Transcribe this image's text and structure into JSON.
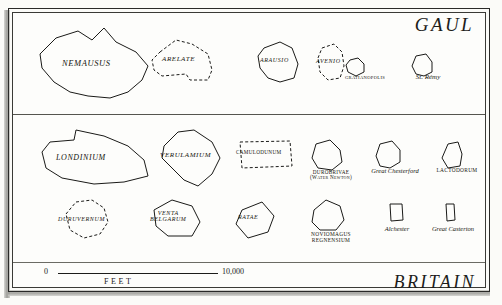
{
  "plate": {
    "background_color": "#fdfdfb",
    "ink_color": "#1a1a18"
  },
  "regions": [
    {
      "id": "gaul",
      "title": "GAUL"
    },
    {
      "id": "britain",
      "title": "BRITAIN"
    }
  ],
  "scale": {
    "zero_label": "0",
    "max_label": "10,000",
    "unit_label": "FEET"
  },
  "towns": [
    {
      "name": "NEMAUSUS",
      "region": "gaul",
      "label_position": "inside",
      "label_style": "small-caps-italic",
      "outline": "solid",
      "font_size": 8.5,
      "x": 32,
      "y": 26,
      "w": 120,
      "h": 74,
      "points": "24,12 46,5 60,14 72,2 84,16 104,26 116,40 110,54 96,66 78,72 56,70 38,66 22,56 10,42 8,28",
      "label_x": 30,
      "label_y": 33
    },
    {
      "name": "ARELATE",
      "region": "gaul",
      "label_position": "inside",
      "label_style": "small-caps-italic",
      "outline": "dashed",
      "font_size": 7,
      "x": 146,
      "y": 36,
      "w": 78,
      "h": 52,
      "points": "14,16 30,4 46,8 62,18 66,34 62,44 44,44 40,38 16,40 8,34 6,24",
      "label_x": 16,
      "label_y": 20
    },
    {
      "name": "ARAUSIO",
      "region": "gaul",
      "label_position": "inside",
      "label_style": "small-caps-italic",
      "outline": "solid",
      "font_size": 6,
      "x": 254,
      "y": 38,
      "w": 50,
      "h": 48,
      "points": "10,10 26,4 38,10 44,26 40,40 26,44 14,40 6,30 4,18",
      "label_x": 6,
      "label_y": 19
    },
    {
      "name": "AVENIO",
      "region": "gaul",
      "label_position": "inside",
      "label_style": "small-caps-italic",
      "outline": "dashed",
      "font_size": 6,
      "x": 312,
      "y": 40,
      "w": 38,
      "h": 46,
      "points": "10,8 22,4 30,12 32,26 28,38 16,40 8,32 6,18",
      "label_x": 4,
      "label_y": 18
    },
    {
      "name": "GRATIANOPOLIS",
      "region": "gaul",
      "label_position": "below",
      "label_style": "small-caps",
      "outline": "solid",
      "font_size": 4.6,
      "x": 338,
      "y": 54,
      "w": 54,
      "h": 28,
      "points": "12,6 20,4 26,10 26,18 18,22 10,18 8,11",
      "label_x": 0,
      "label_y": 22
    },
    {
      "name": "St. Rémy",
      "region": "gaul",
      "label_position": "below",
      "label_style": "script",
      "outline": "solid",
      "font_size": 7,
      "x": 404,
      "y": 50,
      "w": 48,
      "h": 32,
      "points": "12,6 22,4 28,12 28,22 20,26 12,24 8,16",
      "label_x": 0,
      "label_y": 24
    },
    {
      "name": "LONDINIUM",
      "region": "britain",
      "label_position": "inside",
      "label_style": "small-caps-italic",
      "outline": "solid",
      "font_size": 8,
      "x": 32,
      "y": 124,
      "w": 126,
      "h": 66,
      "points": "10,28 18,18 42,16 44,6 72,12 96,22 112,36 116,52 92,58 62,60 30,54 14,44",
      "label_x": 24,
      "label_y": 30
    },
    {
      "name": "VERULAMIUM",
      "region": "britain",
      "label_position": "inside",
      "label_style": "small-caps-italic",
      "outline": "solid",
      "font_size": 7,
      "x": 150,
      "y": 124,
      "w": 86,
      "h": 68,
      "points": "14,22 28,8 44,6 62,18 70,34 62,50 48,62 34,56 22,44 12,34",
      "label_x": 10,
      "label_y": 28
    },
    {
      "name": "CAMULODUNUM",
      "region": "britain",
      "label_position": "inside",
      "label_style": "small-caps",
      "outline": "dashed",
      "font_size": 5.2,
      "x": 234,
      "y": 136,
      "w": 62,
      "h": 38,
      "points": "6,6 56,5 58,30 8,32",
      "label_x": 2,
      "label_y": 14
    },
    {
      "name": "DUROBRIVAE",
      "name2": "(Water Newton)",
      "region": "britain",
      "label_position": "below",
      "label_style": "small-caps",
      "outline": "solid",
      "font_size": 5.2,
      "x": 300,
      "y": 136,
      "w": 62,
      "h": 48,
      "points": "16,8 30,4 40,14 42,26 32,34 18,32 12,22",
      "label_x": 0,
      "label_y": 34
    },
    {
      "name": "Great Chesterford",
      "region": "britain",
      "label_position": "below",
      "label_style": "script",
      "outline": "solid",
      "font_size": 6.5,
      "x": 362,
      "y": 136,
      "w": 66,
      "h": 46,
      "points": "18,8 30,5 38,14 38,26 28,32 18,30 14,20",
      "label_x": 0,
      "label_y": 32
    },
    {
      "name": "LACTODORUM",
      "region": "britain",
      "label_position": "below",
      "label_style": "small-caps",
      "outline": "solid",
      "font_size": 5.4,
      "x": 428,
      "y": 136,
      "w": 58,
      "h": 46,
      "points": "20,8 30,6 34,18 32,30 20,32 14,22",
      "label_x": 0,
      "label_y": 32
    },
    {
      "name": "DURUVERNUM",
      "region": "britain",
      "label_position": "inside",
      "label_style": "small-caps-italic",
      "outline": "dashed",
      "font_size": 6,
      "x": 54,
      "y": 196,
      "w": 64,
      "h": 48,
      "points": "12,18 22,6 38,4 50,12 54,26 46,38 30,42 16,34",
      "label_x": 4,
      "label_y": 20
    },
    {
      "name": "VENTA",
      "name2": "BELGARUM",
      "region": "britain",
      "label_position": "inside",
      "label_style": "small-caps-italic",
      "outline": "solid",
      "font_size": 6,
      "x": 144,
      "y": 196,
      "w": 64,
      "h": 48,
      "points": "10,14 28,4 48,10 56,26 48,40 24,40 12,30",
      "label_x": 6,
      "label_y": 14
    },
    {
      "name": "RATAE",
      "region": "britain",
      "label_position": "inside",
      "label_style": "small-caps-italic",
      "outline": "solid",
      "font_size": 6,
      "x": 228,
      "y": 198,
      "w": 54,
      "h": 44,
      "points": "14,12 34,4 46,18 40,34 20,40 8,26",
      "label_x": 10,
      "label_y": 16
    },
    {
      "name": "NOVIOMAGUS",
      "name2": "REGNENSIUM",
      "region": "britain",
      "label_position": "below",
      "label_style": "small-caps",
      "outline": "solid",
      "font_size": 5.4,
      "x": 296,
      "y": 196,
      "w": 70,
      "h": 52,
      "points": "18,14 30,4 44,10 48,24 40,34 24,34 16,26",
      "label_x": 0,
      "label_y": 36
    },
    {
      "name": "Alchester",
      "region": "britain",
      "label_position": "below",
      "label_style": "script",
      "outline": "solid",
      "font_size": 6.5,
      "x": 372,
      "y": 198,
      "w": 50,
      "h": 46,
      "points": "18,6 30,6 31,22 19,23",
      "label_x": 0,
      "label_y": 28
    },
    {
      "name": "Great Casterton",
      "region": "britain",
      "label_position": "below",
      "label_style": "script",
      "outline": "solid",
      "font_size": 6.5,
      "x": 422,
      "y": 198,
      "w": 62,
      "h": 46,
      "points": "24,6 32,6 33,22 25,23",
      "label_x": 0,
      "label_y": 28
    }
  ]
}
